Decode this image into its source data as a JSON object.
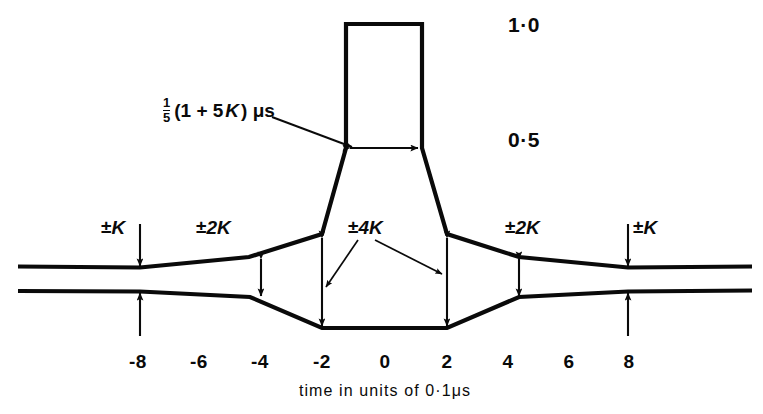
{
  "figure": {
    "type": "pulse-tolerance-mask",
    "axis_caption": "time in units of 0·1μs",
    "amplitude_labels": [
      {
        "text": "1·0",
        "x": 508,
        "y": 14
      },
      {
        "text": "0·5",
        "x": 508,
        "y": 129
      }
    ],
    "formula": {
      "numerator": "1",
      "denominator": "5",
      "body_open": "(1 + 5",
      "body_var": "K",
      "body_close": ") μs",
      "x": 163,
      "y": 96
    },
    "tolerance_labels": [
      {
        "id": "left-outer",
        "sign": "±",
        "value": "K",
        "x": 101,
        "y": 218
      },
      {
        "id": "left-inner",
        "sign": "±",
        "value": "2K",
        "x": 196,
        "y": 218
      },
      {
        "id": "center",
        "sign": "±",
        "value": "4K",
        "x": 348,
        "y": 218
      },
      {
        "id": "right-inner",
        "sign": "±",
        "value": "2K",
        "x": 505,
        "y": 218
      },
      {
        "id": "right-outer",
        "sign": "±",
        "value": "K",
        "x": 633,
        "y": 218
      }
    ],
    "tick_labels": [
      {
        "text": "-8",
        "x": 138,
        "y": 352
      },
      {
        "text": "-6",
        "x": 199,
        "y": 352
      },
      {
        "text": "-4",
        "x": 260,
        "y": 352
      },
      {
        "text": "-2",
        "x": 322,
        "y": 352
      },
      {
        "text": "0",
        "x": 385,
        "y": 352
      },
      {
        "text": "2",
        "x": 447,
        "y": 352
      },
      {
        "text": "4",
        "x": 508,
        "y": 352
      },
      {
        "text": "6",
        "x": 569,
        "y": 352
      },
      {
        "text": "8",
        "x": 629,
        "y": 352
      }
    ],
    "axis_caption_pos": {
      "x": 385,
      "y": 383
    },
    "colors": {
      "ink": "#0a0a0a",
      "background": "#ffffff"
    },
    "geometry": {
      "upper_envelope": "M 18,266 L 140,267 L 249,257 L 322,234 L 346,148 L 346,23 L 422,23 L 422,148 L 447,234 L 519,257 L 628,267 L 752,266",
      "lower_envelope": "M 18,291 L 140,291 L 250,297 L 322,328 L 447,328 L 519,297 L 628,291 L 752,290",
      "width_arrow_y": 148,
      "width_arrow_x1": 346,
      "width_arrow_x2": 422,
      "leader_from": {
        "x": 276,
        "y": 119
      },
      "leader_to": {
        "x": 352,
        "y": 146
      },
      "k_arrows_x": [
        140,
        628
      ],
      "k2_arrows_x": [
        261,
        519
      ],
      "k4_arrows_x": [
        322,
        447
      ],
      "k4_leader_left_to": {
        "x": 325,
        "y": 285
      },
      "k4_leader_right_to": {
        "x": 442,
        "y": 272
      }
    }
  }
}
